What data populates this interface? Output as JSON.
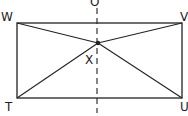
{
  "diagram": {
    "type": "geometry",
    "labels": {
      "top_left": "W",
      "top_right": "V",
      "bottom_left": "T",
      "bottom_right": "U",
      "intersection": "X",
      "axis_top": "O",
      "axis_bottom": "I"
    },
    "colors": {
      "stroke": "#222222",
      "background": "#ffffff"
    }
  }
}
